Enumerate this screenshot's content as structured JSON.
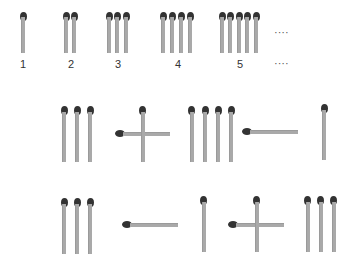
{
  "sequence": {
    "labels": [
      "1",
      "2",
      "3",
      "4",
      "5"
    ],
    "ellipsis_top": "····",
    "ellipsis_bottom": "····"
  },
  "equations": [
    {
      "description": "III + I  III − I"
    },
    {
      "description": "III − I + III"
    }
  ],
  "colors": {
    "stick": "#a9a9a9",
    "head": "#333333"
  }
}
